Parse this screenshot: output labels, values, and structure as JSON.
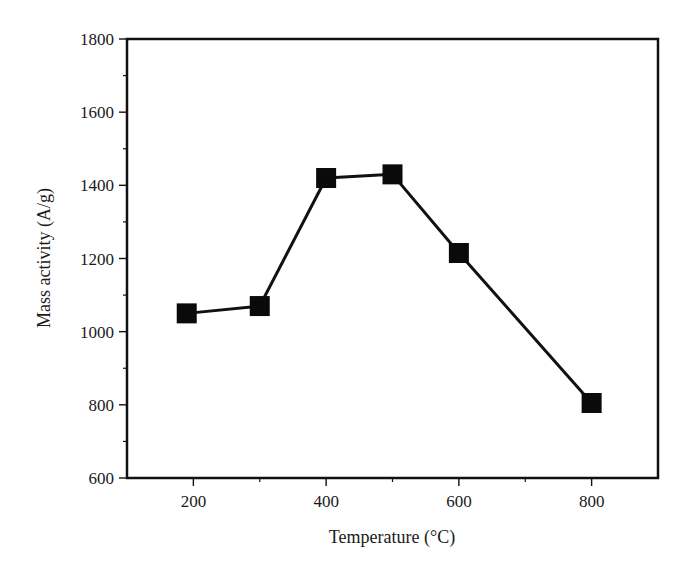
{
  "chart_data": {
    "type": "line",
    "title": "",
    "xlabel": "Temperature (°C)",
    "ylabel": "Mass activity (A/g)",
    "xlim": [
      100,
      900
    ],
    "ylim": [
      600,
      1800
    ],
    "xticks": [
      200,
      400,
      600,
      800
    ],
    "xminor_ticks": [
      300,
      500,
      700
    ],
    "yticks": [
      600,
      800,
      1000,
      1200,
      1400,
      1600,
      1800
    ],
    "yminor_ticks": [
      700,
      900,
      1100,
      1300,
      1500,
      1700
    ],
    "grid": false,
    "legend": null,
    "marker": "square",
    "series": [
      {
        "name": "Mass activity",
        "x": [
          190,
          300,
          400,
          500,
          600,
          800
        ],
        "y": [
          1050,
          1070,
          1420,
          1430,
          1215,
          805
        ]
      }
    ]
  },
  "labels": {
    "xlabel": "Temperature (°C)",
    "ylabel": "Mass activity (A/g)",
    "xticks": [
      "200",
      "400",
      "600",
      "800"
    ],
    "yticks": [
      "600",
      "800",
      "1000",
      "1200",
      "1400",
      "1600",
      "1800"
    ]
  },
  "colors": {
    "line": "#111111",
    "marker": "#0a0a0a",
    "axis": "#111111"
  }
}
